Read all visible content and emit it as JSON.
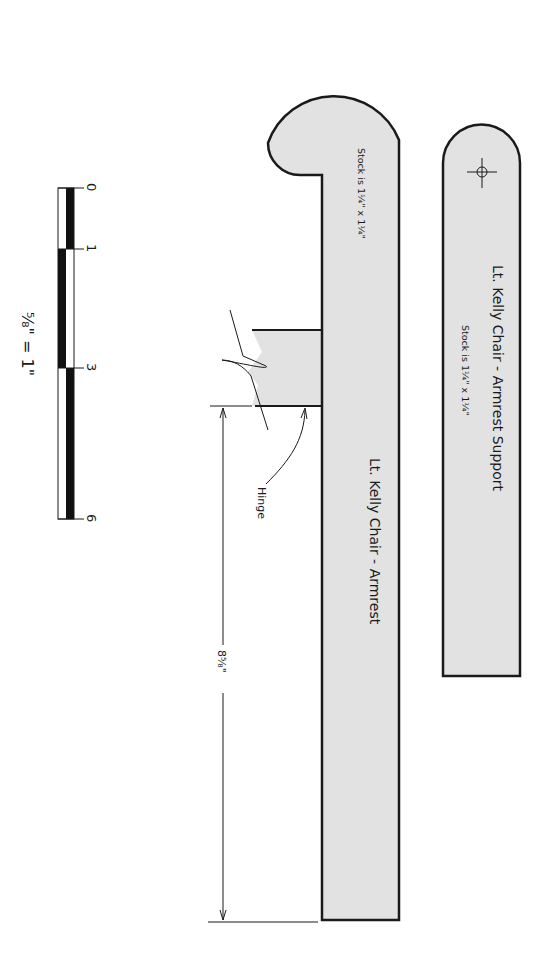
{
  "support": {
    "title": "Lt. Kelly Chair - Armrest Support",
    "stock": "Stock is 1¼\" x 1¼\"",
    "marker_icon": "crosshair-circle"
  },
  "armrest": {
    "title": "Lt. Kelly Chair - Armrest",
    "stock": "Stock is 1¼\" x 1¼\"",
    "hinge_label": "Hinge",
    "dimension_label": "8⅝\""
  },
  "scale": {
    "ticks": [
      "0",
      "1",
      "3",
      "6"
    ],
    "ratio_label": "⅝\" = 1\""
  },
  "colors": {
    "part_fill": "#e2e2e2",
    "outline": "#1a1a1a",
    "background": "#ffffff"
  }
}
